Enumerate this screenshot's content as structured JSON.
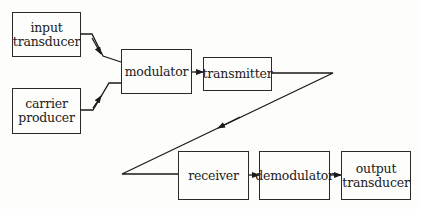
{
  "diagram": {
    "type": "block diagram",
    "blocks": [
      {
        "id": "input_transducer",
        "label": "input\ntransducer"
      },
      {
        "id": "carrier_producer",
        "label": "carrier\nproducer"
      },
      {
        "id": "modulator",
        "label": "modulator"
      },
      {
        "id": "transmitter",
        "label": "transmitter"
      },
      {
        "id": "receiver",
        "label": "receiver"
      },
      {
        "id": "demodulator",
        "label": "demodulator"
      },
      {
        "id": "output_transducer",
        "label": "output\ntransducer"
      }
    ],
    "edges": [
      {
        "from": "input_transducer",
        "to": "modulator"
      },
      {
        "from": "carrier_producer",
        "to": "modulator"
      },
      {
        "from": "modulator",
        "to": "transmitter"
      },
      {
        "from": "transmitter",
        "to": "receiver",
        "style": "zigzag transmission path"
      },
      {
        "from": "receiver",
        "to": "demodulator"
      },
      {
        "from": "demodulator",
        "to": "output_transducer"
      }
    ]
  }
}
